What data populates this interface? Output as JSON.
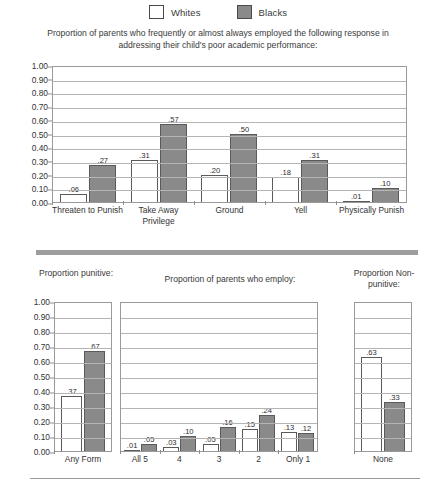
{
  "legend": {
    "entries": [
      {
        "label": "Whites",
        "swatch": "white-swatch",
        "color": "#ffffff"
      },
      {
        "label": "Blacks",
        "swatch": "gray-swatch",
        "color": "#8a8a8a"
      }
    ]
  },
  "captions": {
    "top": "Proportion of parents who frequently or almost always employed the following response in addressing their child's poor academic performance:",
    "left": "Proportion punitive:",
    "middle": "Proportion of parents who employ:",
    "right": "Proportion Non-punitive:"
  },
  "axis": {
    "ticks": [
      "1.00",
      "0.90",
      "0.80",
      "0.70",
      "0.60",
      "0.50",
      "0.40",
      "0.30",
      "0.20",
      "0.10",
      "0.00"
    ]
  },
  "chart_data": [
    {
      "id": "main",
      "type": "bar",
      "title": "Proportion of parents who frequently or almost always employed the following response in addressing their child's poor academic performance:",
      "xlabel": "",
      "ylabel": "",
      "ylim": [
        0,
        1
      ],
      "ytick_step": 0.1,
      "grid": true,
      "legend_position": "top-center",
      "categories": [
        "Threaten to Punish",
        "Take Away Privilege",
        "Ground",
        "Yell",
        "Physically Punish"
      ],
      "series": [
        {
          "name": "Whites",
          "color": "#ffffff",
          "values": [
            0.06,
            0.31,
            0.2,
            0.18,
            0.01
          ],
          "labels": [
            ".06",
            ".31",
            ".20",
            ".18",
            ".01"
          ]
        },
        {
          "name": "Blacks",
          "color": "#8a8a8a",
          "values": [
            0.27,
            0.57,
            0.5,
            0.31,
            0.1
          ],
          "labels": [
            ".27",
            ".57",
            ".50",
            ".31",
            ".10"
          ]
        }
      ]
    },
    {
      "id": "punitive",
      "type": "bar",
      "title": "Proportion punitive:",
      "ylim": [
        0,
        1
      ],
      "ytick_step": 0.1,
      "grid": true,
      "categories": [
        "Any Form"
      ],
      "series": [
        {
          "name": "Whites",
          "color": "#ffffff",
          "values": [
            0.37
          ],
          "labels": [
            ".37"
          ]
        },
        {
          "name": "Blacks",
          "color": "#8a8a8a",
          "values": [
            0.67
          ],
          "labels": [
            ".67"
          ]
        }
      ]
    },
    {
      "id": "employ",
      "type": "bar",
      "title": "Proportion of parents who employ:",
      "ylim": [
        0,
        1
      ],
      "ytick_step": 0.1,
      "grid": true,
      "categories": [
        "All 5",
        "4",
        "3",
        "2",
        "Only 1"
      ],
      "series": [
        {
          "name": "Whites",
          "color": "#ffffff",
          "values": [
            0.01,
            0.03,
            0.05,
            0.15,
            0.13
          ],
          "labels": [
            ".01",
            ".03",
            ".05",
            ".15",
            ".13"
          ]
        },
        {
          "name": "Blacks",
          "color": "#8a8a8a",
          "values": [
            0.05,
            0.1,
            0.16,
            0.24,
            0.12
          ],
          "labels": [
            ".05",
            ".10",
            ".16",
            ".24",
            ".12"
          ]
        }
      ]
    },
    {
      "id": "nonpunitive",
      "type": "bar",
      "title": "Proportion Non-punitive:",
      "ylim": [
        0,
        1
      ],
      "ytick_step": 0.1,
      "grid": true,
      "categories": [
        "None"
      ],
      "series": [
        {
          "name": "Whites",
          "color": "#ffffff",
          "values": [
            0.63
          ],
          "labels": [
            ".63"
          ]
        },
        {
          "name": "Blacks",
          "color": "#8a8a8a",
          "values": [
            0.33
          ],
          "labels": [
            ".33"
          ]
        }
      ]
    }
  ]
}
